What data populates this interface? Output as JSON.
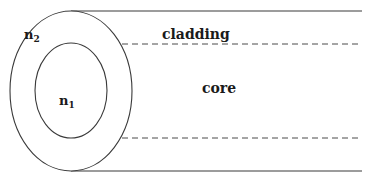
{
  "diagram": {
    "type": "optical-fiber-cross-section",
    "labels": {
      "cladding": "cladding",
      "core": "core",
      "n2_base": "n",
      "n2_sub": "2",
      "n1_base": "n",
      "n1_sub": "1"
    },
    "colors": {
      "stroke": "#3a3a3a",
      "dashed": "#4a4a4a",
      "text": "#1a1a1a",
      "background": "#ffffff"
    },
    "geometry": {
      "outer_ellipse": {
        "cx": 71,
        "cy": 91,
        "rx": 61,
        "ry": 80
      },
      "inner_ellipse": {
        "cx": 71,
        "cy": 90.5,
        "rx": 36,
        "ry": 47.5
      },
      "top_solid_line": {
        "x1": 71,
        "y1": 11,
        "x2": 362,
        "y2": 11
      },
      "bottom_solid_line": {
        "x1": 71,
        "y1": 171,
        "x2": 362,
        "y2": 171
      },
      "top_dashed_line": {
        "x1": 72,
        "y1": 44,
        "x2": 362,
        "y2": 44
      },
      "bottom_dashed_line": {
        "x1": 72,
        "y1": 138,
        "x2": 362,
        "y2": 138
      }
    }
  }
}
